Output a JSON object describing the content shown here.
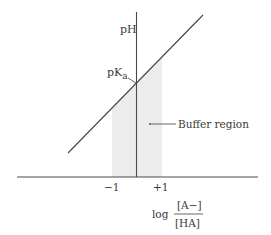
{
  "diagram": {
    "y_axis_label": "pH",
    "pka_label_main": "pK",
    "pka_label_sub": "a",
    "buffer_label": "Buffer region",
    "x_axis_label_prefix": "log",
    "x_axis_numerator": "[A−]",
    "x_axis_denominator": "[HA]",
    "ticks": [
      {
        "label": "−1",
        "value": -1
      },
      {
        "label": "+1",
        "value": 1
      }
    ],
    "buffer_range": [
      -1,
      1
    ],
    "line": {
      "slope": 1,
      "intercept_label": "pKa"
    },
    "colors": {
      "shade": "#ececec",
      "line": "#444444",
      "text": "#3a3a3a"
    }
  }
}
